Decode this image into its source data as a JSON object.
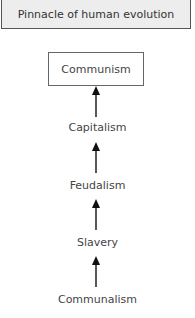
{
  "diagram": {
    "header": "Pinnacle of human evolution",
    "top_node": "Communism",
    "stages": [
      "Capitalism",
      "Feudalism",
      "Slavery",
      "Communalism"
    ],
    "direction": "bottom-to-top",
    "colors": {
      "header_fill": "#ededed",
      "border": "#555555",
      "text": "#444444",
      "arrow": "#111111"
    }
  }
}
